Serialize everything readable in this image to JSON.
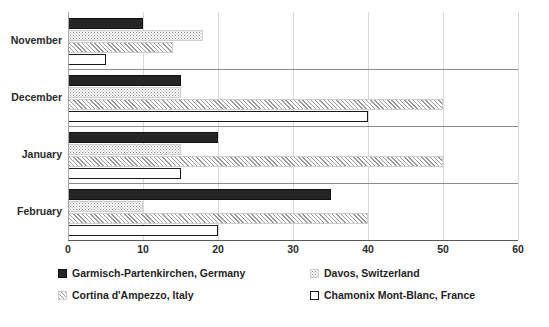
{
  "chart_data": {
    "type": "bar",
    "orientation": "horizontal",
    "title": "",
    "subtitle": "",
    "xlabel": "",
    "ylabel": "",
    "xlim": [
      0,
      60
    ],
    "xticks": [
      0,
      10,
      20,
      30,
      40,
      50,
      60
    ],
    "xtick_labels": [
      "0",
      "10",
      "20",
      "30",
      "40",
      "50",
      "60"
    ],
    "grid": true,
    "grid_axis": "x",
    "legend_position": "bottom",
    "categories": [
      "November",
      "December",
      "January",
      "February"
    ],
    "series": [
      {
        "name": "Garmisch-Partenkirchen, Germany",
        "pattern": "solid-dark",
        "color": "#262626",
        "values": [
          10,
          15,
          20,
          35
        ]
      },
      {
        "name": "Davos, Switzerland",
        "pattern": "dotted",
        "color": "#8f8f8f",
        "values": [
          18,
          15,
          15,
          10
        ]
      },
      {
        "name": "Cortina d'Ampezzo, Italy",
        "pattern": "diagonal-hatch",
        "color": "#9a9a9a",
        "values": [
          14,
          50,
          50,
          40
        ]
      },
      {
        "name": "Chamonix Mont-Blanc, France",
        "pattern": "white-outline",
        "color": "#ffffff",
        "values": [
          5,
          40,
          15,
          20
        ]
      }
    ]
  },
  "axis": {
    "tick_0": "0",
    "tick_1": "10",
    "tick_2": "20",
    "tick_3": "30",
    "tick_4": "40",
    "tick_5": "50",
    "tick_6": "60"
  },
  "categories": {
    "cat_0": "November",
    "cat_1": "December",
    "cat_2": "January",
    "cat_3": "February"
  },
  "legend": {
    "item_0": "Garmisch-Partenkirchen, Germany",
    "item_1": "Davos, Switzerland",
    "item_2": "Cortina d'Ampezzo, Italy",
    "item_3": "Chamonix Mont-Blanc, France"
  },
  "colors": {
    "series_1": "#262626",
    "series_2": "#8f8f8f",
    "series_3": "#9a9a9a",
    "series_4": "#ffffff",
    "gridline": "#d9d9d9",
    "axis": "#595959"
  }
}
